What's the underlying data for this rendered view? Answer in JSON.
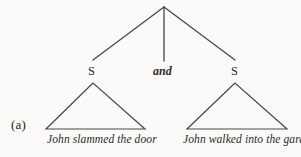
{
  "figure": {
    "label": "(a)",
    "background_color": "#fbfaf8",
    "ink_color": "#3a3a3a"
  },
  "tree": {
    "root": {
      "name": "root-node",
      "x": 164,
      "y": 7
    },
    "branches": [
      {
        "name": "branch-left",
        "x1": 164,
        "y1": 7,
        "x2": 93,
        "y2": 60
      },
      {
        "name": "branch-middle",
        "x1": 164,
        "y1": 7,
        "x2": 164,
        "y2": 61
      },
      {
        "name": "branch-right",
        "x1": 164,
        "y1": 7,
        "x2": 235,
        "y2": 60
      }
    ],
    "nodes": [
      {
        "name": "s-node-left",
        "label": "S",
        "x": 93,
        "y": 72
      },
      {
        "name": "conjunction",
        "label": "and",
        "x": 164,
        "y": 72
      },
      {
        "name": "s-node-right",
        "label": "S",
        "x": 235,
        "y": 72
      }
    ],
    "triangles": [
      {
        "name": "triangle-left",
        "apex_x": 93,
        "apex_y": 83,
        "base_left_x": 46,
        "base_right_x": 145,
        "base_y": 129
      },
      {
        "name": "triangle-right",
        "apex_x": 235,
        "apex_y": 83,
        "base_left_x": 187,
        "base_right_x": 287,
        "base_y": 129
      }
    ],
    "leaves": [
      {
        "name": "leaf-clause-left",
        "text": "John slammed the door"
      },
      {
        "name": "leaf-clause-right",
        "text": "John walked into the garden"
      }
    ]
  }
}
